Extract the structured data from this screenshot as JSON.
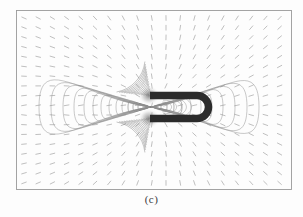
{
  "figure": {
    "panel_label": "(c)",
    "title": "",
    "background_color": "#fdfdfd"
  },
  "frame": {
    "x": 16,
    "y": 10,
    "width": 275,
    "height": 179,
    "stroke_color": "#9a9a9a",
    "stroke_width": 0.9
  },
  "chart_data": {
    "type": "line",
    "subtype": "contour-quiver-field-map",
    "title": "",
    "subtitle": "",
    "xlabel": "",
    "ylabel": "",
    "xlim": [
      0,
      275
    ],
    "ylim": [
      0,
      179
    ],
    "xticklabels": [],
    "yticklabels": [],
    "grid": false,
    "legend": null,
    "annotations": [
      "(c)"
    ],
    "symmetry_axis_y": 107,
    "pole_points": [
      {
        "name": "north-pole-tip",
        "x": 151,
        "y": 96
      },
      {
        "name": "south-pole-tip",
        "x": 151,
        "y": 118
      }
    ],
    "contour_colors": {
      "line": "#8d8d8d",
      "inner_line": "#6f6f6f"
    },
    "left_lobe_contours": [
      {
        "level": 1,
        "half_width": 8,
        "half_height": 7
      },
      {
        "level": 2,
        "half_width": 13,
        "half_height": 10
      },
      {
        "level": 3,
        "half_width": 18,
        "half_height": 13
      },
      {
        "level": 4,
        "half_width": 23,
        "half_height": 17
      },
      {
        "level": 5,
        "half_width": 29,
        "half_height": 21
      },
      {
        "level": 6,
        "half_width": 35,
        "half_height": 25
      },
      {
        "level": 7,
        "half_width": 42,
        "half_height": 30
      },
      {
        "level": 8,
        "half_width": 50,
        "half_height": 35
      },
      {
        "level": 9,
        "half_width": 58,
        "half_height": 41
      },
      {
        "level": 10,
        "half_width": 67,
        "half_height": 47
      },
      {
        "level": 11,
        "half_width": 77,
        "half_height": 54
      },
      {
        "level": 12,
        "half_width": 88,
        "half_height": 62
      },
      {
        "level": 13,
        "half_width": 100,
        "half_height": 70
      },
      {
        "level": 14,
        "half_width": 112,
        "half_height": 78
      }
    ],
    "right_lobe_contours": [
      {
        "level": 1,
        "half_width": 10,
        "half_height": 8
      },
      {
        "level": 2,
        "half_width": 16,
        "half_height": 12
      },
      {
        "level": 3,
        "half_width": 23,
        "half_height": 16
      },
      {
        "level": 4,
        "half_width": 31,
        "half_height": 21
      },
      {
        "level": 5,
        "half_width": 40,
        "half_height": 27
      },
      {
        "level": 6,
        "half_width": 50,
        "half_height": 34
      },
      {
        "level": 7,
        "half_width": 61,
        "half_height": 42
      },
      {
        "level": 8,
        "half_width": 72,
        "half_height": 50
      },
      {
        "level": 9,
        "half_width": 84,
        "half_height": 59
      },
      {
        "level": 10,
        "half_width": 96,
        "half_height": 68
      },
      {
        "level": 11,
        "half_width": 108,
        "half_height": 76
      }
    ],
    "quiver": {
      "columns": 19,
      "rows": 18,
      "x_start": 24,
      "y_start": 18,
      "x_spacing": 14.2,
      "y_spacing": 9.7,
      "marker_color": "#b4b4b4",
      "marker_length": 2.4
    }
  },
  "magnet": {
    "shape": "horseshoe-u-magnet",
    "opening_direction": "left",
    "color": "#2b2b2b",
    "arm_thickness": 7.5,
    "outer_left_x": 150,
    "cap_center_x": 197,
    "cap_radius": 11.5,
    "top_arm_center_y": 95.5,
    "bottom_arm_center_y": 118.5,
    "pole_glow_color": "#9c9c9c"
  }
}
